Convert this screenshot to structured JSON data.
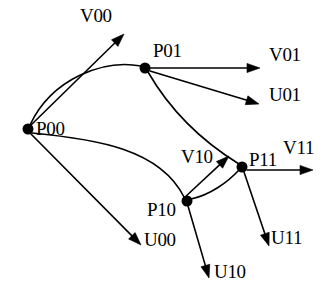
{
  "figure": {
    "type": "vector-diagram",
    "background_color": "#ffffff",
    "stroke_color": "#000000",
    "node_fill_color": "#000000",
    "node_radius_px": 5.5,
    "stroke_width_px": 1.6,
    "canvas": {
      "width": 331,
      "height": 297
    }
  },
  "nodes": [
    {
      "id": "P00",
      "label": "P00",
      "x": 28,
      "y": 129,
      "label_x": 36,
      "label_y": 119
    },
    {
      "id": "P01",
      "label": "P01",
      "x": 145,
      "y": 68,
      "label_x": 153,
      "label_y": 41
    },
    {
      "id": "P10",
      "label": "P10",
      "x": 187,
      "y": 201,
      "label_x": 147,
      "label_y": 200
    },
    {
      "id": "P11",
      "label": "P11",
      "x": 242,
      "y": 167,
      "label_x": 249,
      "label_y": 150
    }
  ],
  "vector_labels": [
    {
      "id": "V00",
      "label": "V00",
      "label_x": 80,
      "label_y": 6
    },
    {
      "id": "V01",
      "label": "V01",
      "label_x": 269,
      "label_y": 45
    },
    {
      "id": "U01",
      "label": "U01",
      "label_x": 269,
      "label_y": 85
    },
    {
      "id": "V10",
      "label": "V10",
      "label_x": 181,
      "label_y": 147
    },
    {
      "id": "V11",
      "label": "V11",
      "label_x": 283,
      "label_y": 138
    },
    {
      "id": "U00",
      "label": "U00",
      "label_x": 144,
      "label_y": 230
    },
    {
      "id": "U10",
      "label": "U10",
      "label_x": 214,
      "label_y": 262
    },
    {
      "id": "U11",
      "label": "U11",
      "label_x": 271,
      "label_y": 228
    }
  ],
  "arrows": [
    {
      "id": "V00-arrow",
      "from": "P00",
      "to_label": "V00",
      "tip_x": 124,
      "tip_y": 34,
      "tail_x": 30,
      "tail_y": 126
    },
    {
      "id": "U00-arrow",
      "from": "P00",
      "to_label": "U00",
      "tip_x": 141,
      "tip_y": 245,
      "tail_x": 31,
      "tail_y": 134
    },
    {
      "id": "V01-arrow",
      "from": "P01",
      "to_label": "V01",
      "tip_x": 260,
      "tip_y": 68,
      "tail_x": 150,
      "tail_y": 68
    },
    {
      "id": "U01-arrow",
      "from": "P01",
      "to_label": "U01",
      "tip_x": 259,
      "tip_y": 104,
      "tail_x": 150,
      "tail_y": 71
    },
    {
      "id": "V10-arrow",
      "from": "P10",
      "to_label": "V10",
      "tip_x": 229,
      "tip_y": 156,
      "tail_x": 184,
      "tail_y": 198
    },
    {
      "id": "U10-arrow",
      "from": "P10",
      "to_label": "U10",
      "tip_x": 209,
      "tip_y": 278,
      "tail_x": 188,
      "tail_y": 206
    },
    {
      "id": "V11-arrow",
      "from": "P11",
      "to_label": "V11",
      "tip_x": 313,
      "tip_y": 170,
      "tail_x": 247,
      "tail_y": 170
    },
    {
      "id": "U11-arrow",
      "from": "P11",
      "to_label": "U11",
      "tip_x": 269,
      "tip_y": 246,
      "tail_x": 244,
      "tail_y": 172
    }
  ],
  "curves": [
    {
      "id": "P00-P01-curve",
      "from": "P00",
      "to": "P01",
      "path": "M 30 125 C 52 78 104 59 141 66"
    },
    {
      "id": "P00-P10-curve",
      "from": "P00",
      "to": "P10",
      "path": "M 32 133 C 96 139 160 149 184 197"
    },
    {
      "id": "P01-P11-curve",
      "from": "P01",
      "to": "P11",
      "path": "M 148 72 C 170 110 200 140 239 164"
    },
    {
      "id": "P10-P11-curve",
      "from": "P10",
      "to": "P11",
      "path": "M 191 199 C 210 195 228 182 239 170"
    }
  ],
  "arrowhead": {
    "length_px": 13,
    "half_width_px": 4.6
  }
}
